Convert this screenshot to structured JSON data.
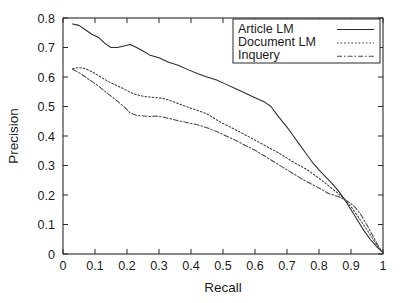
{
  "chart_data": {
    "type": "line",
    "title": "",
    "xlabel": "Recall",
    "ylabel": "Precision",
    "xlim": [
      0,
      1
    ],
    "ylim": [
      0,
      0.8
    ],
    "grid": false,
    "legend_position": "top-right",
    "xticks": [
      "0",
      "0.1",
      "0.2",
      "0.3",
      "0.4",
      "0.5",
      "0.6",
      "0.7",
      "0.8",
      "0.9",
      "1"
    ],
    "xtick_values": [
      0,
      0.1,
      0.2,
      0.3,
      0.4,
      0.5,
      0.6,
      0.7,
      0.8,
      0.9,
      1
    ],
    "yticks": [
      "0",
      "0.1",
      "0.2",
      "0.3",
      "0.4",
      "0.5",
      "0.6",
      "0.7",
      "0.8"
    ],
    "ytick_values": [
      0,
      0.1,
      0.2,
      0.3,
      0.4,
      0.5,
      0.6,
      0.7,
      0.8
    ],
    "series": [
      {
        "name": "Article LM",
        "style": "solid",
        "color": "#2b2b2b",
        "x": [
          0.03,
          0.05,
          0.07,
          0.09,
          0.11,
          0.13,
          0.15,
          0.17,
          0.19,
          0.21,
          0.23,
          0.25,
          0.27,
          0.3,
          0.33,
          0.36,
          0.39,
          0.42,
          0.45,
          0.48,
          0.51,
          0.54,
          0.57,
          0.6,
          0.63,
          0.65,
          0.67,
          0.7,
          0.72,
          0.74,
          0.76,
          0.78,
          0.8,
          0.82,
          0.84,
          0.86,
          0.88,
          0.9,
          0.92,
          0.94,
          0.96,
          0.98,
          1.0
        ],
        "y": [
          0.78,
          0.775,
          0.76,
          0.745,
          0.735,
          0.715,
          0.7,
          0.7,
          0.705,
          0.71,
          0.7,
          0.688,
          0.675,
          0.665,
          0.65,
          0.64,
          0.625,
          0.612,
          0.6,
          0.59,
          0.575,
          0.56,
          0.545,
          0.53,
          0.515,
          0.5,
          0.47,
          0.43,
          0.4,
          0.37,
          0.34,
          0.31,
          0.285,
          0.262,
          0.24,
          0.215,
          0.185,
          0.15,
          0.115,
          0.08,
          0.05,
          0.025,
          0.005
        ]
      },
      {
        "name": "Document LM",
        "style": "dotted",
        "color": "#3a3a3a",
        "x": [
          0.03,
          0.05,
          0.07,
          0.09,
          0.11,
          0.13,
          0.15,
          0.17,
          0.19,
          0.21,
          0.23,
          0.25,
          0.27,
          0.29,
          0.31,
          0.33,
          0.36,
          0.39,
          0.42,
          0.45,
          0.47,
          0.49,
          0.52,
          0.55,
          0.58,
          0.61,
          0.64,
          0.67,
          0.7,
          0.73,
          0.76,
          0.79,
          0.82,
          0.84,
          0.86,
          0.88,
          0.9,
          0.92,
          0.94,
          0.96,
          0.98,
          1.0
        ],
        "y": [
          0.628,
          0.632,
          0.628,
          0.618,
          0.605,
          0.592,
          0.58,
          0.57,
          0.56,
          0.548,
          0.54,
          0.535,
          0.532,
          0.53,
          0.528,
          0.522,
          0.51,
          0.498,
          0.487,
          0.475,
          0.462,
          0.448,
          0.432,
          0.415,
          0.398,
          0.38,
          0.362,
          0.345,
          0.325,
          0.305,
          0.288,
          0.265,
          0.24,
          0.222,
          0.205,
          0.185,
          0.16,
          0.13,
          0.098,
          0.065,
          0.032,
          0.005
        ]
      },
      {
        "name": "Inquery",
        "style": "dashdot",
        "color": "#4a4a4a",
        "x": [
          0.03,
          0.05,
          0.07,
          0.09,
          0.11,
          0.13,
          0.15,
          0.17,
          0.19,
          0.21,
          0.23,
          0.25,
          0.27,
          0.29,
          0.31,
          0.33,
          0.36,
          0.39,
          0.42,
          0.45,
          0.48,
          0.51,
          0.54,
          0.57,
          0.6,
          0.63,
          0.66,
          0.69,
          0.72,
          0.75,
          0.78,
          0.81,
          0.83,
          0.85,
          0.86,
          0.87,
          0.89,
          0.91,
          0.93,
          0.95,
          0.97,
          0.99,
          1.0
        ],
        "y": [
          0.626,
          0.615,
          0.6,
          0.585,
          0.57,
          0.552,
          0.535,
          0.518,
          0.5,
          0.478,
          0.47,
          0.468,
          0.466,
          0.468,
          0.465,
          0.46,
          0.452,
          0.445,
          0.438,
          0.428,
          0.415,
          0.4,
          0.385,
          0.368,
          0.352,
          0.332,
          0.312,
          0.292,
          0.272,
          0.252,
          0.235,
          0.218,
          0.205,
          0.198,
          0.195,
          0.19,
          0.178,
          0.162,
          0.135,
          0.098,
          0.058,
          0.018,
          0.004
        ]
      }
    ]
  },
  "legend": {
    "entries": [
      {
        "label": "Article LM"
      },
      {
        "label": "Document LM"
      },
      {
        "label": "Inquery"
      }
    ]
  },
  "axes": {
    "x_title": "Recall",
    "y_title": "Precision"
  }
}
